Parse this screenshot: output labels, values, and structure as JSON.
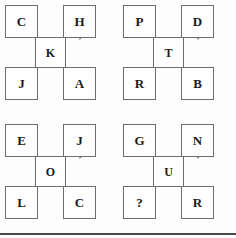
{
  "diagram": {
    "type": "letter-square-puzzle",
    "answer_placeholder": "?",
    "colors": {
      "background": "#fdfdfd",
      "box_fill": "#fefefe",
      "border": "#6d6d6d",
      "text": "#1b1b1b",
      "rule": "#4a4a4a"
    },
    "clusters": [
      {
        "id": "cluster-1",
        "position": "top-left",
        "top_left": "C",
        "top_right": "H",
        "center": "K",
        "bottom_left": "J",
        "bottom_right": "A"
      },
      {
        "id": "cluster-2",
        "position": "top-right",
        "top_left": "P",
        "top_right": "D",
        "center": "T",
        "bottom_left": "R",
        "bottom_right": "B"
      },
      {
        "id": "cluster-3",
        "position": "bottom-left",
        "top_left": "E",
        "top_right": "J",
        "center": "O",
        "bottom_left": "L",
        "bottom_right": "C"
      },
      {
        "id": "cluster-4",
        "position": "bottom-right",
        "top_left": "G",
        "top_right": "N",
        "center": "U",
        "bottom_left": "?",
        "bottom_right": "R"
      }
    ]
  }
}
